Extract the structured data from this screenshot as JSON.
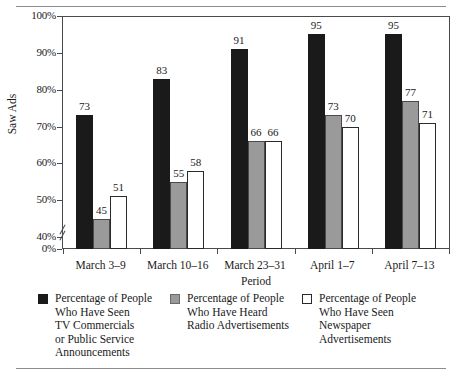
{
  "figure": {
    "rules": [
      "top-rule",
      "bottom-rule"
    ]
  },
  "chart_data": {
    "type": "bar",
    "title": "",
    "subtitle": "",
    "xlabel": "Period",
    "ylabel": "Saw Ads",
    "categories": [
      "March 3–9",
      "March 10–16",
      "March 23–31",
      "April 1–7",
      "April 7–13"
    ],
    "series": [
      {
        "name": "Percentage of People Who Have Seen TV Commercials or Public Service Announcements",
        "color": "#1a1a1a",
        "values": [
          73,
          83,
          91,
          95,
          95
        ]
      },
      {
        "name": "Percentage of People Who Have Heard Radio Advertisements",
        "color": "#9a9a9a",
        "values": [
          45,
          55,
          66,
          73,
          77
        ]
      },
      {
        "name": "Percentage of People Who Have Seen Newspaper Advertisements",
        "color": "#ffffff",
        "values": [
          51,
          58,
          66,
          70,
          71
        ]
      }
    ],
    "ylim": [
      40,
      100
    ],
    "yticks": [
      "0%",
      "40%",
      "50%",
      "60%",
      "70%",
      "80%",
      "90%",
      "100%"
    ],
    "ytick_values": [
      0,
      40,
      50,
      60,
      70,
      80,
      90,
      100
    ],
    "axis_break": true,
    "axis_break_between": [
      0,
      40
    ],
    "grid": false,
    "legend_position": "bottom",
    "value_labels": true
  },
  "legend": [
    {
      "swatch": "black-filled-square",
      "label": "Percentage of People\nWho Have Seen\nTV Commercials\nor Public Service\nAnnouncements"
    },
    {
      "swatch": "gray-filled-square",
      "label": "Percentage of People\nWho Have Heard\nRadio Advertisements"
    },
    {
      "swatch": "white-outlined-square",
      "label": "Percentage of People\nWho Have Seen\nNewspaper\nAdvertisements"
    }
  ]
}
